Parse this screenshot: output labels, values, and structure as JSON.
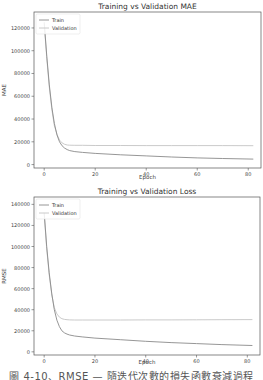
{
  "chart_data": [
    {
      "type": "line",
      "title": "Training vs Validation MAE",
      "xlabel": "Epoch",
      "ylabel": "MAE",
      "xlim": [
        -4,
        85
      ],
      "ylim": [
        -3000,
        134000
      ],
      "xticks": [
        0,
        20,
        40,
        60,
        80
      ],
      "yticks": [
        0,
        20000,
        40000,
        60000,
        80000,
        100000,
        120000
      ],
      "ytick_labels": [
        "0",
        "20000",
        "40000",
        "60000",
        "80000",
        "100000",
        "120000"
      ],
      "grid": false,
      "legend_position": "upper left",
      "x": [
        0,
        1,
        2,
        3,
        4,
        5,
        6,
        7,
        8,
        9,
        10,
        12,
        15,
        20,
        30,
        40,
        50,
        60,
        70,
        82
      ],
      "series": [
        {
          "name": "Train",
          "color": "#8a8a8a",
          "values": [
            125000,
            95000,
            70000,
            50000,
            36000,
            26000,
            20000,
            16500,
            14500,
            13200,
            12300,
            11400,
            10700,
            9800,
            8600,
            7600,
            6700,
            5900,
            5300,
            4800
          ]
        },
        {
          "name": "Validation",
          "color": "#c4c4c4",
          "values": [
            124000,
            93000,
            68000,
            48000,
            34000,
            26500,
            21500,
            19000,
            17800,
            17200,
            17000,
            16900,
            16900,
            16800,
            16800,
            16700,
            16700,
            16700,
            16700,
            16600
          ]
        }
      ]
    },
    {
      "type": "line",
      "title": "Training vs Validation Loss",
      "xlabel": "Epoch",
      "ylabel": "RMSE",
      "xlim": [
        -4,
        85
      ],
      "ylim": [
        -3000,
        147000
      ],
      "xticks": [
        0,
        20,
        40,
        60,
        80
      ],
      "yticks": [
        0,
        20000,
        40000,
        60000,
        80000,
        100000,
        120000,
        140000
      ],
      "ytick_labels": [
        "0",
        "20000",
        "40000",
        "60000",
        "80000",
        "100000",
        "120000",
        "140000"
      ],
      "grid": false,
      "legend_position": "upper left",
      "x": [
        0,
        1,
        2,
        3,
        4,
        5,
        6,
        7,
        8,
        9,
        10,
        12,
        15,
        20,
        30,
        40,
        50,
        60,
        70,
        82
      ],
      "series": [
        {
          "name": "Train",
          "color": "#8a8a8a",
          "values": [
            132000,
            100000,
            75000,
            55000,
            40000,
            30000,
            24000,
            20000,
            18000,
            16800,
            16000,
            15000,
            14200,
            13000,
            11500,
            10000,
            8800,
            7800,
            6900,
            6000
          ]
        },
        {
          "name": "Validation",
          "color": "#c4c4c4",
          "values": [
            131000,
            98000,
            73000,
            54000,
            42000,
            36000,
            33000,
            31500,
            30800,
            30500,
            30300,
            30200,
            30200,
            30200,
            30200,
            30300,
            30300,
            30400,
            30500,
            30600
          ]
        }
      ]
    }
  ],
  "charts": [
    {
      "title": "Training vs Validation MAE",
      "xlabel": "Epoch",
      "ylabel": "MAE",
      "legend": [
        "Train",
        "Validation"
      ]
    },
    {
      "title": "Training vs Validation Loss",
      "xlabel": "Epoch",
      "ylabel": "RMSE",
      "legend": [
        "Train",
        "Validation"
      ]
    }
  ],
  "caption": "圖 4-10、RMSE — 隨迭代次數的損失函數衰減過程"
}
